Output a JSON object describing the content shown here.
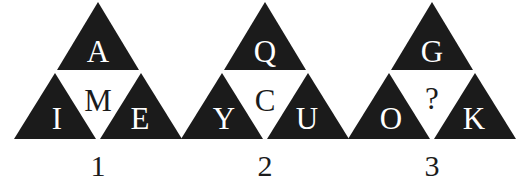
{
  "canvas": {
    "width": 526,
    "height": 191,
    "background_color": "#ffffff"
  },
  "style": {
    "triangle_fill": "#1b1b1b",
    "center_fill": "#ffffff",
    "light_letter_color": "#ffffff",
    "dark_letter_color": "#1b1b1b"
  },
  "puzzle": {
    "type": "letter-triangle-sequence",
    "figures": [
      {
        "label": "1",
        "top": "A",
        "center": "M",
        "bottom_left": "I",
        "bottom_right": "E",
        "center_is_unknown": false
      },
      {
        "label": "2",
        "top": "Q",
        "center": "C",
        "bottom_left": "Y",
        "bottom_right": "U",
        "center_is_unknown": false
      },
      {
        "label": "3",
        "top": "G",
        "center": "?",
        "bottom_left": "O",
        "bottom_right": "K",
        "center_is_unknown": true
      }
    ]
  }
}
